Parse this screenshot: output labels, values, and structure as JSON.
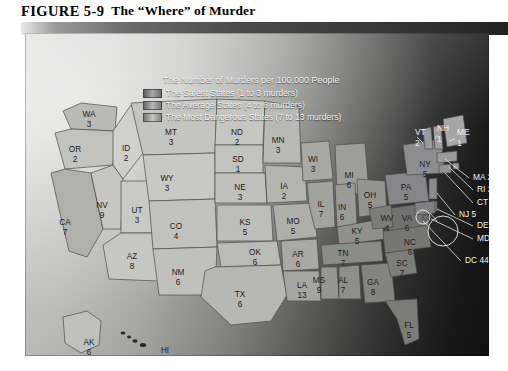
{
  "figure": {
    "number": "FIGURE 5-9",
    "title": "The “Where” of Murder"
  },
  "legend": {
    "title": "The Number of Murders per 100,000 People",
    "items": [
      {
        "label": "The Safest States (1 to 3 murders)",
        "swatch": "safe",
        "range": "1-3"
      },
      {
        "label": "The Average States (4 to 6 murders)",
        "swatch": "average",
        "range": "4-6"
      },
      {
        "label": "The Most Dangerous States (7 to 13 murders)",
        "swatch": "dangerous",
        "range": "7-13"
      }
    ]
  },
  "chart_data": {
    "type": "map",
    "title": "The “Where” of Murder",
    "value_label": "Murders per 100,000 People",
    "bins": [
      {
        "name": "Safest",
        "min": 1,
        "max": 3
      },
      {
        "name": "Average",
        "min": 4,
        "max": 6
      },
      {
        "name": "Most Dangerous",
        "min": 7,
        "max": 13
      }
    ],
    "states": [
      {
        "code": "WA",
        "value": 3,
        "x": 64,
        "y": 82,
        "tone": "#b9b9b6"
      },
      {
        "code": "OR",
        "value": 2,
        "x": 50,
        "y": 117,
        "tone": "#c2c2bf"
      },
      {
        "code": "CA",
        "value": 7,
        "x": 40,
        "y": 190,
        "tone": "#b0b0ad"
      },
      {
        "code": "NV",
        "value": 9,
        "x": 77,
        "y": 173,
        "tone": "#c6c6c3"
      },
      {
        "code": "ID",
        "value": 2,
        "x": 101,
        "y": 116,
        "tone": "#cfcfcc"
      },
      {
        "code": "UT",
        "value": 3,
        "x": 112,
        "y": 178,
        "tone": "#c9c9c6"
      },
      {
        "code": "AZ",
        "value": 8,
        "x": 107,
        "y": 224,
        "tone": "#c6c6c3"
      },
      {
        "code": "MT",
        "value": 3,
        "x": 146,
        "y": 100,
        "tone": "#c4c4c1"
      },
      {
        "code": "WY",
        "value": 3,
        "x": 142,
        "y": 146,
        "tone": "#c8c8c5"
      },
      {
        "code": "CO",
        "value": 4,
        "x": 151,
        "y": 194,
        "tone": "#c1c1be"
      },
      {
        "code": "NM",
        "value": 6,
        "x": 153,
        "y": 240,
        "tone": "#c0c0bd"
      },
      {
        "code": "ND",
        "value": 2,
        "x": 212,
        "y": 100,
        "tone": "#c6c6c3"
      },
      {
        "code": "SD",
        "value": 1,
        "x": 213,
        "y": 127,
        "tone": "#c3c3c0"
      },
      {
        "code": "NE",
        "value": 3,
        "x": 215,
        "y": 155,
        "tone": "#c0c0bd"
      },
      {
        "code": "KS",
        "value": 5,
        "x": 220,
        "y": 190,
        "tone": "#bdbdba"
      },
      {
        "code": "OK",
        "value": 6,
        "x": 230,
        "y": 220,
        "tone": "#babab7"
      },
      {
        "code": "TX",
        "value": 6,
        "x": 215,
        "y": 262,
        "tone": "#b7b7b4"
      },
      {
        "code": "MN",
        "value": 3,
        "x": 253,
        "y": 108,
        "tone": "#b9b9b6"
      },
      {
        "code": "IA",
        "value": 2,
        "x": 259,
        "y": 154,
        "tone": "#b4b4b1"
      },
      {
        "code": "MO",
        "value": 5,
        "x": 268,
        "y": 189,
        "tone": "#aeaeab"
      },
      {
        "code": "AR",
        "value": 6,
        "x": 273,
        "y": 222,
        "tone": "#a9a9a6"
      },
      {
        "code": "LA",
        "value": 13,
        "x": 277,
        "y": 253,
        "tone": "#a5a5a2"
      },
      {
        "code": "WI",
        "value": 3,
        "x": 288,
        "y": 127,
        "tone": "#a8a8a5"
      },
      {
        "code": "IL",
        "value": 7,
        "x": 296,
        "y": 172,
        "tone": "#a2a29f"
      },
      {
        "code": "MI",
        "value": 6,
        "x": 324,
        "y": 143,
        "tone": "#9d9d9a"
      },
      {
        "code": "IN",
        "value": 6,
        "x": 317,
        "y": 175,
        "tone": "#9a9a97"
      },
      {
        "code": "OH",
        "value": 5,
        "x": 345,
        "y": 163,
        "tone": "#949491"
      },
      {
        "code": "KY",
        "value": 5,
        "x": 332,
        "y": 199,
        "tone": "#8f8f8c"
      },
      {
        "code": "TN",
        "value": 7,
        "x": 318,
        "y": 221,
        "tone": "#8b8b88"
      },
      {
        "code": "MS",
        "value": 9,
        "x": 294,
        "y": 248,
        "tone": "#959592"
      },
      {
        "code": "AL",
        "value": 7,
        "x": 318,
        "y": 248,
        "tone": "#8e8e8b"
      },
      {
        "code": "GA",
        "value": 8,
        "x": 348,
        "y": 250,
        "tone": "#848481"
      },
      {
        "code": "FL",
        "value": 5,
        "x": 384,
        "y": 293,
        "tone": "#7b7b78"
      },
      {
        "code": "SC",
        "value": 7,
        "x": 377,
        "y": 231,
        "tone": "#7d7d7a"
      },
      {
        "code": "NC",
        "value": 6,
        "x": 385,
        "y": 210,
        "tone": "#767673"
      },
      {
        "code": "VA",
        "value": 6,
        "x": 382,
        "y": 186,
        "tone": "#717170"
      },
      {
        "code": "WV",
        "value": 4,
        "x": 362,
        "y": 186,
        "tone": "#7c7c79"
      },
      {
        "code": "PA",
        "value": 5,
        "x": 381,
        "y": 155,
        "tone": "#86868a"
      },
      {
        "code": "NY",
        "value": 5,
        "x": 400,
        "y": 132,
        "tone": "#8d8d90"
      },
      {
        "code": "AK",
        "value": 6,
        "x": 64,
        "y": 310,
        "tone": "#c0c0bd"
      },
      {
        "code": "HI",
        "value": 2,
        "x": 140,
        "y": 318,
        "tone": "#c4c4c1"
      }
    ],
    "callout_states": [
      {
        "code": "VT",
        "value": 2,
        "label": "VT",
        "value_text": "2",
        "x": 390,
        "y": 100,
        "stacked": true
      },
      {
        "code": "NH",
        "value": 1,
        "label": "NH",
        "value_text": "1",
        "x": 412,
        "y": 96,
        "stacked": true
      },
      {
        "code": "ME",
        "value": 1,
        "label": "ME",
        "value_text": "1",
        "x": 432,
        "y": 100,
        "stacked": true
      },
      {
        "code": "MA",
        "value": 2,
        "label": "MA 2",
        "x": 448,
        "y": 145
      },
      {
        "code": "RI",
        "value": 2,
        "label": "RI 2",
        "x": 452,
        "y": 157
      },
      {
        "code": "CT",
        "value": 3,
        "label": "CT 3",
        "x": 452,
        "y": 170
      },
      {
        "code": "NJ",
        "value": 5,
        "label": "NJ 5",
        "x": 434,
        "y": 182
      },
      {
        "code": "DE",
        "value": 3,
        "label": "DE 3",
        "x": 452,
        "y": 193
      },
      {
        "code": "MD",
        "value": 10,
        "label": "MD 10",
        "x": 452,
        "y": 206
      },
      {
        "code": "DC",
        "value": 44,
        "label": "DC 44",
        "x": 440,
        "y": 228
      }
    ]
  }
}
